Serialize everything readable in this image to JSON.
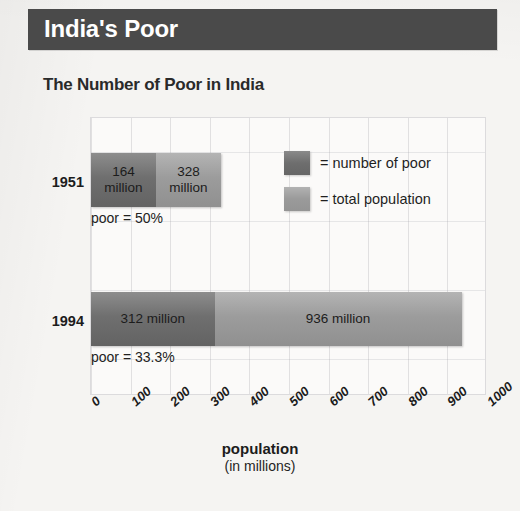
{
  "header": {
    "title": "India's Poor"
  },
  "chart_data": {
    "type": "bar",
    "orientation": "horizontal",
    "stacked": false,
    "title": "The Number of Poor in India",
    "xlabel": "population",
    "xlabel_sub": "(in millions)",
    "ylabel": "",
    "xlim": [
      0,
      1000
    ],
    "xticks": [
      0,
      100,
      200,
      300,
      400,
      500,
      600,
      700,
      800,
      900,
      1000
    ],
    "xtick_labels": [
      "0",
      "100",
      "200",
      "300",
      "400",
      "500",
      "600",
      "700",
      "800",
      "900",
      "1000"
    ],
    "grid": true,
    "legend_position": "inside-top-right",
    "categories": [
      "1951",
      "1994"
    ],
    "series": [
      {
        "name": "number of poor",
        "values": [
          164,
          312
        ],
        "color": "#6f6f6f"
      },
      {
        "name": "total population",
        "values": [
          328,
          936
        ],
        "color": "#9c9c9c"
      }
    ],
    "bars": [
      {
        "year": "1951",
        "poor_value": 164,
        "poor_label": "164\nmillion",
        "total_value": 328,
        "total_label": "328\nmillion",
        "note": "poor = 50%"
      },
      {
        "year": "1994",
        "poor_value": 312,
        "poor_label": "312 million",
        "total_value": 936,
        "total_label": "936 million",
        "note": "poor = 33.3%"
      }
    ],
    "legend": [
      {
        "label": "= number of poor",
        "swatch": "poor"
      },
      {
        "label": "= total population",
        "swatch": "total"
      }
    ]
  },
  "colors": {
    "banner": "#4a4a4a",
    "banner_text": "#ffffff",
    "poor": "#6f6f6f",
    "total": "#9c9c9c",
    "page": "#f5f4f2"
  }
}
